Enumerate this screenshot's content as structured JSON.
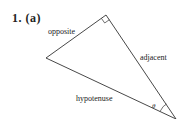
{
  "problem": {
    "label": "1. (a)"
  },
  "triangle": {
    "vertices": {
      "right_angle": [
        106,
        15
      ],
      "left": [
        46,
        58
      ],
      "theta": [
        176,
        119
      ]
    },
    "sides": {
      "opposite": "opposite",
      "adjacent": "adjacent",
      "hypotenuse": "hypotenuse"
    },
    "angle_label": "θ",
    "stroke_color": "#333333"
  }
}
